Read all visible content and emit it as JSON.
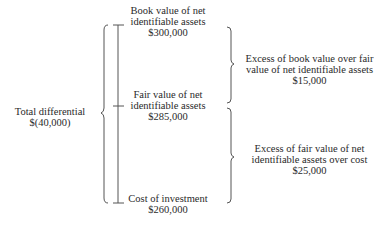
{
  "diagram": {
    "total": {
      "line1": "Total differential",
      "line2": "$(40,000)"
    },
    "book_value": {
      "line1": "Book value of net",
      "line2": "identifiable assets",
      "amount": "$300,000"
    },
    "fair_value": {
      "line1": "Fair value of net",
      "line2": "identifiable assets",
      "amount": "$285,000"
    },
    "cost": {
      "line1": "Cost of investment",
      "amount": "$260,000"
    },
    "excess_book_over_fair": {
      "line1": "Excess of book value over fair",
      "line2": "value of net identifiable assets",
      "amount": "$15,000"
    },
    "excess_fair_over_cost": {
      "line1": "Excess of fair value of net",
      "line2": "identifiable assets over cost",
      "amount": "$25,000"
    },
    "colors": {
      "text": "#2a2a2a",
      "line": "#555555"
    }
  }
}
